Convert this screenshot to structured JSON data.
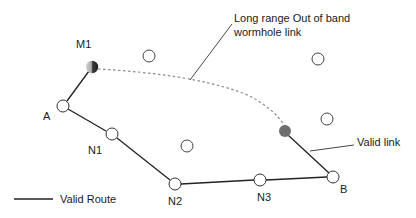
{
  "diagram": {
    "type": "network-topology",
    "nodes": [
      {
        "id": "M1",
        "label": "M1",
        "x": 92,
        "y": 67,
        "style": "malicious-gradient",
        "label_x": 76,
        "label_y": 48
      },
      {
        "id": "A",
        "label": "A",
        "x": 63,
        "y": 106,
        "style": "open",
        "label_x": 43,
        "label_y": 120
      },
      {
        "id": "N1",
        "label": "N1",
        "x": 112,
        "y": 134,
        "style": "open",
        "label_x": 88,
        "label_y": 154
      },
      {
        "id": "N2",
        "label": "N2",
        "x": 175,
        "y": 184,
        "style": "open",
        "label_x": 168,
        "label_y": 205
      },
      {
        "id": "N3",
        "label": "N3",
        "x": 260,
        "y": 180,
        "style": "open",
        "label_x": 257,
        "label_y": 201
      },
      {
        "id": "B",
        "label": "B",
        "x": 333,
        "y": 177,
        "style": "open",
        "label_x": 340,
        "label_y": 193
      },
      {
        "id": "M2",
        "label": "",
        "x": 285,
        "y": 131,
        "style": "malicious-dark"
      },
      {
        "id": "U1",
        "label": "",
        "x": 149,
        "y": 56,
        "style": "open"
      },
      {
        "id": "U2",
        "label": "",
        "x": 318,
        "y": 59,
        "style": "open"
      },
      {
        "id": "U3",
        "label": "",
        "x": 327,
        "y": 119,
        "style": "open"
      },
      {
        "id": "U4",
        "label": "",
        "x": 187,
        "y": 146,
        "style": "open"
      }
    ],
    "edges": [
      {
        "from": "M1",
        "to": "A",
        "kind": "solid"
      },
      {
        "from": "A",
        "to": "N1",
        "kind": "solid"
      },
      {
        "from": "N1",
        "to": "N2",
        "kind": "solid"
      },
      {
        "from": "N2",
        "to": "N3",
        "kind": "solid"
      },
      {
        "from": "N3",
        "to": "B",
        "kind": "solid"
      },
      {
        "from": "M2",
        "to": "B",
        "kind": "solid"
      },
      {
        "from": "M1",
        "to": "M2",
        "kind": "dashed-curve"
      }
    ],
    "annotations": {
      "wormhole": {
        "line1": "Long range Out of band",
        "line2": "wormhole link"
      },
      "valid_link": "Valid link"
    },
    "legend": {
      "valid_route": "Valid Route"
    },
    "colors": {
      "line": "#222222",
      "dashed": "#8a8a8a",
      "node_stroke": "#333333",
      "node_fill": "#ffffff",
      "malicious_dark": "#6e6e6e"
    }
  }
}
